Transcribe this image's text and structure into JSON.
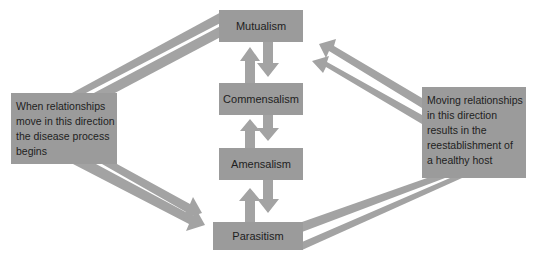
{
  "colors": {
    "box_fill": "#9b9b9b",
    "arrow_fill": "#a3a3a3",
    "text": "#1e1e1e",
    "background": "#ffffff"
  },
  "diagram": {
    "relationships": [
      {
        "id": "mutualism",
        "label": "Mutualism"
      },
      {
        "id": "commensalism",
        "label": "Commensalism"
      },
      {
        "id": "amensalism",
        "label": "Amensalism"
      },
      {
        "id": "parasitism",
        "label": "Parasitism"
      }
    ],
    "left_note": {
      "lines": [
        "When relationships",
        "move in this direction",
        "the disease process",
        "begins"
      ]
    },
    "right_note": {
      "lines": [
        "Moving relationships",
        "in this direction",
        "results in the",
        "reestablishment of",
        "a healthy host"
      ]
    },
    "connections": [
      {
        "from": "commensalism",
        "to": "mutualism",
        "type": "up-arrow"
      },
      {
        "from": "mutualism",
        "to": "commensalism",
        "type": "down-arrow"
      },
      {
        "from": "amensalism",
        "to": "commensalism",
        "type": "up-arrow"
      },
      {
        "from": "commensalism",
        "to": "amensalism",
        "type": "down-arrow"
      },
      {
        "from": "parasitism",
        "to": "amensalism",
        "type": "up-arrow"
      },
      {
        "from": "amensalism",
        "to": "parasitism",
        "type": "down-arrow"
      },
      {
        "from": "mutualism",
        "to": "parasitism",
        "via": "left_note",
        "type": "double-band-arrow"
      },
      {
        "from": "parasitism",
        "to": "mutualism",
        "via": "right_note",
        "type": "double-band-arrow"
      }
    ]
  }
}
